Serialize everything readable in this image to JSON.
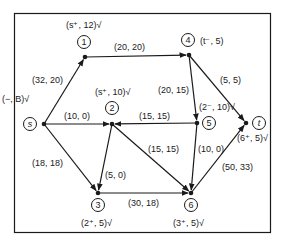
{
  "diagram": {
    "nodes": [
      {
        "id": "s",
        "label": "s",
        "italic": true,
        "circle": [
          30,
          124
        ],
        "dot": [
          44,
          124
        ],
        "tag": "(−, B)√",
        "tag_pos": [
          2,
          102
        ]
      },
      {
        "id": "1",
        "label": "1",
        "italic": false,
        "circle": [
          84,
          42
        ],
        "dot": [
          85,
          57
        ],
        "tag": "(s⁺, 12)√",
        "tag_pos": [
          66,
          28
        ]
      },
      {
        "id": "4",
        "label": "4",
        "italic": false,
        "circle": [
          188,
          40
        ],
        "dot": [
          189,
          55
        ],
        "tag": "(t⁻, 5)",
        "tag_pos": [
          200,
          44
        ]
      },
      {
        "id": "2",
        "label": "2",
        "italic": false,
        "circle": [
          112,
          108
        ],
        "dot": [
          112,
          124
        ],
        "tag": "(s⁺, 10)√",
        "tag_pos": [
          95,
          95
        ]
      },
      {
        "id": "5",
        "label": "5",
        "italic": false,
        "circle": [
          209,
          123
        ],
        "dot": [
          197,
          123
        ],
        "tag": "(2⁻, 10)√",
        "tag_pos": [
          199,
          110
        ]
      },
      {
        "id": "t",
        "label": "t",
        "italic": true,
        "circle": [
          259,
          123
        ],
        "dot": [
          246,
          123
        ],
        "tag": "(6⁺, 5)√",
        "tag_pos": [
          237,
          141
        ]
      },
      {
        "id": "3",
        "label": "3",
        "italic": false,
        "circle": [
          98,
          205
        ],
        "dot": [
          98,
          193
        ],
        "tag": "(2⁺, 5)√",
        "tag_pos": [
          81,
          226
        ]
      },
      {
        "id": "6",
        "label": "6",
        "italic": false,
        "circle": [
          191,
          205
        ],
        "dot": [
          191,
          193
        ],
        "tag": "(3⁺, 5)√",
        "tag_pos": [
          173,
          226
        ]
      }
    ],
    "edges": [
      {
        "from": "s",
        "to": "1",
        "label": "(32, 20)",
        "label_pos": [
          32,
          83
        ],
        "x1": 44,
        "y1": 124,
        "x2": 85,
        "y2": 57
      },
      {
        "from": "1",
        "to": "4",
        "label": "(20, 20)",
        "label_pos": [
          114,
          50
        ],
        "x1": 85,
        "y1": 57,
        "x2": 189,
        "y2": 55
      },
      {
        "from": "s",
        "to": "2",
        "label": "(10, 0)",
        "label_pos": [
          64,
          119
        ],
        "x1": 44,
        "y1": 124,
        "x2": 112,
        "y2": 124
      },
      {
        "from": "5",
        "to": "2",
        "label": "(15, 15)",
        "label_pos": [
          139,
          119
        ],
        "x1": 197,
        "y1": 123,
        "x2": 112,
        "y2": 124
      },
      {
        "from": "4",
        "to": "5",
        "label": "(20, 15)",
        "label_pos": [
          158,
          93
        ],
        "x1": 189,
        "y1": 55,
        "x2": 197,
        "y2": 123
      },
      {
        "from": "4",
        "to": "t",
        "label": "(5, 5)",
        "label_pos": [
          220,
          83
        ],
        "x1": 189,
        "y1": 55,
        "x2": 246,
        "y2": 123
      },
      {
        "from": "s",
        "to": "3",
        "label": "(18, 18)",
        "label_pos": [
          32,
          166
        ],
        "x1": 44,
        "y1": 124,
        "x2": 98,
        "y2": 193
      },
      {
        "from": "2",
        "to": "3",
        "label": "(5, 0)",
        "label_pos": [
          105,
          178
        ],
        "x1": 112,
        "y1": 124,
        "x2": 98,
        "y2": 193
      },
      {
        "from": "2",
        "to": "6",
        "label": "(15, 15)",
        "label_pos": [
          148,
          152
        ],
        "x1": 112,
        "y1": 124,
        "x2": 191,
        "y2": 193
      },
      {
        "from": "5",
        "to": "6",
        "label": "(10, 0)",
        "label_pos": [
          198,
          152
        ],
        "x1": 197,
        "y1": 123,
        "x2": 191,
        "y2": 193
      },
      {
        "from": "3",
        "to": "6",
        "label": "(30, 18)",
        "label_pos": [
          128,
          206
        ],
        "x1": 98,
        "y1": 193,
        "x2": 191,
        "y2": 193
      },
      {
        "from": "6",
        "to": "t",
        "label": "(50, 33)",
        "label_pos": [
          222,
          170
        ],
        "x1": 191,
        "y1": 193,
        "x2": 246,
        "y2": 123
      }
    ]
  },
  "colors": {
    "stroke": "#1a1a1a",
    "background": "#ffffff"
  }
}
